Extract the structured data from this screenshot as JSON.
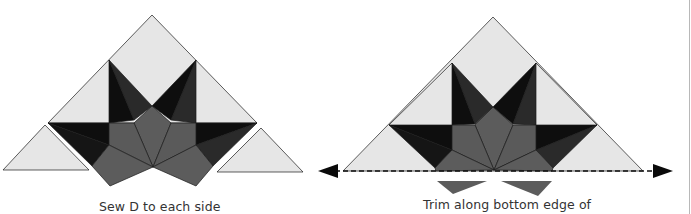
{
  "figure": {
    "left_panel": {
      "caption": "Sew D to each side",
      "description": "Star block unit with light setting triangles D placed at each lower side"
    },
    "right_panel": {
      "caption": "Trim along bottom edge of",
      "description": "Assembled unit with dashed trim line along bottom edge and arrows at each end; trimmed-off gray pieces shown below"
    }
  },
  "colors": {
    "light_fabric": "#e6e6e6",
    "black_fabric": "#0e0e0e",
    "dark_gray_fabric": "#2a2a2a",
    "medium_gray_fabric": "#5c5c5c",
    "outline": "#1a1a1a",
    "caption_text": "#333333"
  },
  "icons": {
    "trim_arrow_left": "arrow-left-triangle",
    "trim_arrow_right": "arrow-right-triangle"
  }
}
